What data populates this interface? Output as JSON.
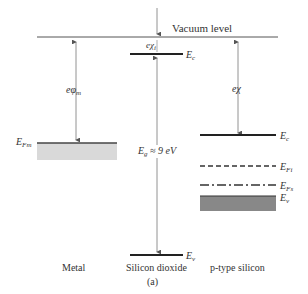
{
  "diagram": {
    "vacuum_label": "Vacuum level",
    "metal": {
      "label": "Metal",
      "work_function": {
        "sym": "eφ",
        "sub": "m"
      },
      "fermi": {
        "sym": "E",
        "sub": "Fm"
      }
    },
    "oxide": {
      "label": "Silicon dioxide",
      "affinity": {
        "sym": "eχ",
        "sub": "i"
      },
      "ec": {
        "sym": "E",
        "sub": "c"
      },
      "ev": {
        "sym": "E",
        "sub": "v"
      },
      "gap": "E",
      "gap_sub": "g",
      "gap_val": " ≈ 9 eV"
    },
    "silicon": {
      "label": "p-type silicon",
      "affinity": "eχ",
      "ec": {
        "sym": "E",
        "sub": "c"
      },
      "efi": {
        "sym": "E",
        "sub": "Fi"
      },
      "efs": {
        "sym": "E",
        "sub": "Fs"
      },
      "ev": {
        "sym": "E",
        "sub": "v"
      }
    },
    "caption": "(a)",
    "colors": {
      "line": "#333333",
      "band_fill": "#888888",
      "metal_fill": "#d9d9d9"
    }
  }
}
